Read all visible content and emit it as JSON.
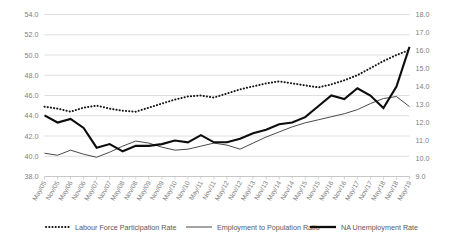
{
  "chart_data": {
    "type": "line",
    "title": "",
    "xlabel": "",
    "ylabel": "",
    "grid": true,
    "legend_position": "bottom",
    "categories": [
      "May/05",
      "Nov/05",
      "May/06",
      "Nov/06",
      "May/07",
      "Nov/07",
      "May/08",
      "Nov/08",
      "May/09",
      "Nov/09",
      "May/10",
      "Nov/10",
      "May/11",
      "Nov/11",
      "May/12",
      "Nov/12",
      "May/13",
      "Nov/13",
      "May/14",
      "Nov/14",
      "May/15",
      "Nov/15",
      "May/16",
      "Nov/16",
      "May/17",
      "Nov/17",
      "May/18",
      "Nov/18",
      "May/19"
    ],
    "axes": {
      "left": {
        "min": 38.0,
        "max": 54.0,
        "step": 2.0,
        "ticks": [
          "38.0",
          "40.0",
          "42.0",
          "44.0",
          "46.0",
          "48.0",
          "50.0",
          "52.0",
          "54.0"
        ]
      },
      "right": {
        "min": 9.0,
        "max": 18.0,
        "step": 1.0,
        "ticks": [
          "9.0",
          "10.0",
          "11.0",
          "12.0",
          "13.0",
          "14.0",
          "15.0",
          "16.0",
          "17.0",
          "18.0"
        ]
      }
    },
    "series": [
      {
        "name": "Labour Force Participation Rate",
        "axis": "left",
        "style": "dotted",
        "color": "#161616",
        "values": [
          44.9,
          44.7,
          44.4,
          44.8,
          45.0,
          44.7,
          44.5,
          44.4,
          44.8,
          45.2,
          45.6,
          45.9,
          46.0,
          45.8,
          46.2,
          46.6,
          46.9,
          47.2,
          47.4,
          47.2,
          47.0,
          46.8,
          47.1,
          47.5,
          48.0,
          48.7,
          49.4,
          50.0,
          50.5
        ]
      },
      {
        "name": "Employment to Population Ratio",
        "axis": "left",
        "style": "thin",
        "color": "#4a4a4a",
        "values": [
          40.3,
          40.1,
          40.6,
          40.2,
          39.9,
          40.4,
          41.0,
          41.5,
          41.3,
          40.9,
          40.6,
          40.7,
          41.0,
          41.3,
          41.1,
          40.7,
          41.3,
          41.9,
          42.4,
          42.9,
          43.3,
          43.6,
          43.9,
          44.2,
          44.6,
          45.2,
          45.7,
          45.9,
          44.9
        ]
      },
      {
        "name": "NA Unemployment Rate",
        "axis": "right",
        "style": "thick",
        "color": "#0d0d0d",
        "values": [
          12.4,
          12.0,
          12.2,
          11.7,
          10.6,
          10.8,
          10.4,
          10.7,
          10.7,
          10.8,
          11.0,
          10.9,
          11.3,
          10.9,
          10.9,
          11.1,
          11.4,
          11.6,
          11.9,
          12.0,
          12.3,
          12.9,
          13.5,
          13.3,
          13.9,
          13.5,
          12.8,
          14.0,
          16.2
        ]
      }
    ],
    "annotations": {
      "peak_unemployment_value": 17.45,
      "peak_unemployment_category": "Nov/08"
    }
  },
  "legend": {
    "items": [
      {
        "label": "Labour Force Participation Rate",
        "marker": "dotted-line-marker"
      },
      {
        "label": "Employment to Population Ratio",
        "marker": "thin-line-marker"
      },
      {
        "label": "NA Unemployment Rate",
        "marker": "thick-line-marker"
      }
    ]
  }
}
